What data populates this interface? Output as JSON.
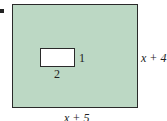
{
  "diagram": {
    "problem_marker": "bullet",
    "outer_rectangle": {
      "fill_color": "#bcd8c4",
      "border_color": "#2a2a2a",
      "width_label": "x + 5",
      "height_label": "x + 4"
    },
    "inner_rectangle": {
      "fill_color": "#ffffff",
      "border_color": "#2a2a2a",
      "width_label": "2",
      "height_label": "1"
    }
  }
}
